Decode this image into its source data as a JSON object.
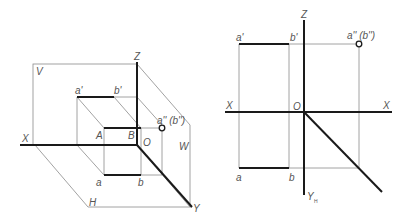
{
  "figure": {
    "left_title": "Axonometric view of line AB perpendicular to W plane",
    "right_title": "Three-view projection of line AB",
    "colors": {
      "thin_line": "#8a8a8a",
      "thick_line": "#1a1a1a",
      "label": "#555555"
    }
  },
  "left": {
    "labels": {
      "z": "Z",
      "x": "X",
      "y": "Y",
      "o": "O",
      "v_plane": "V",
      "h_plane": "H",
      "w_plane": "W",
      "a_prime": "a'",
      "b_prime": "b'",
      "A": "A",
      "B": "B",
      "a": "a",
      "b": "b",
      "a_dprime": "a'' (b'')"
    }
  },
  "right": {
    "labels": {
      "z": "Z",
      "x_left": "X",
      "x_right": "X",
      "o": "O",
      "y_h": "Y",
      "y_h_sub": "H",
      "a_prime": "a'",
      "b_prime": "b'",
      "a": "a",
      "b": "b",
      "a_dprime": "a'' (b'')"
    }
  }
}
